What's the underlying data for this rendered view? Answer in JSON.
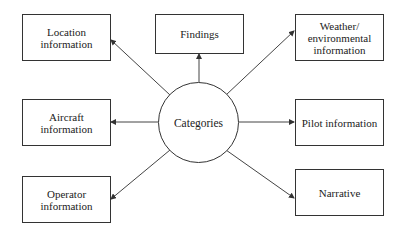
{
  "diagram": {
    "center": {
      "label": "Categories"
    },
    "nodes": [
      {
        "id": "location",
        "label": "Location\ninformation"
      },
      {
        "id": "aircraft",
        "label": "Aircraft\ninformation"
      },
      {
        "id": "operator",
        "label": "Operator\ninformation"
      },
      {
        "id": "findings",
        "label": "Findings"
      },
      {
        "id": "weather",
        "label": "Weather/\nenvironmental\ninformation"
      },
      {
        "id": "pilot",
        "label": "Pilot information"
      },
      {
        "id": "narrative",
        "label": "Narrative"
      }
    ],
    "edges": [
      {
        "from": "Categories",
        "to": "Location information"
      },
      {
        "from": "Categories",
        "to": "Aircraft information"
      },
      {
        "from": "Categories",
        "to": "Operator information"
      },
      {
        "from": "Categories",
        "to": "Findings"
      },
      {
        "from": "Categories",
        "to": "Weather/environmental information"
      },
      {
        "from": "Categories",
        "to": "Pilot information"
      },
      {
        "from": "Categories",
        "to": "Narrative"
      }
    ]
  }
}
